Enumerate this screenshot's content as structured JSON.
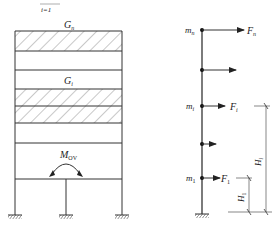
{
  "header_fragment": {
    "text": "i=1"
  },
  "left_frame": {
    "labels": {
      "top_load": "G",
      "top_load_sub": "n",
      "mid_load": "G",
      "mid_load_sub": "i",
      "moment": "M",
      "moment_sub": "OV"
    },
    "bands": [
      {
        "name": "roof-floor",
        "hatched": true
      },
      {
        "name": "story",
        "hatched": false
      },
      {
        "name": "floor-i-upper",
        "hatched": true
      },
      {
        "name": "floor-i-lower",
        "hatched": true
      },
      {
        "name": "story",
        "hatched": false
      }
    ]
  },
  "right_model": {
    "nodes": [
      {
        "mass": "m",
        "mass_sub": "n",
        "force": "F",
        "force_sub": "n"
      },
      {
        "mass": "",
        "mass_sub": "",
        "force": "",
        "force_sub": ""
      },
      {
        "mass": "m",
        "mass_sub": "i",
        "force": "F",
        "force_sub": "i"
      },
      {
        "mass": "",
        "mass_sub": "",
        "force": "",
        "force_sub": ""
      },
      {
        "mass": "m",
        "mass_sub": "1",
        "force": "F",
        "force_sub": "1"
      }
    ],
    "dimensions": [
      {
        "label": "H",
        "label_sub": "i"
      },
      {
        "label": "H",
        "label_sub": "1"
      }
    ]
  },
  "colors": {
    "line": "#333333",
    "background": "#ffffff"
  }
}
